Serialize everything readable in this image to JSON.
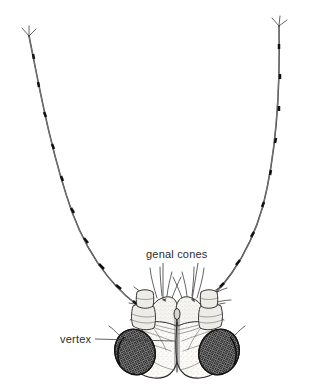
{
  "figure": {
    "background_color": "#ffffff",
    "ink_color": "#2a2a2a",
    "label_color": "#2b2b2b",
    "width": 322,
    "height": 391
  },
  "labels": [
    {
      "id": "genal-cones",
      "text": "genal cones",
      "x": 146,
      "y": 258,
      "leaders": 2
    },
    {
      "id": "vertex",
      "text": "vertex",
      "x": 60,
      "y": 343,
      "leaders": 1
    }
  ],
  "structures": {
    "antenna_left_label": "left antenna",
    "antenna_right_label": "right antenna",
    "eye_left_label": "left compound eye",
    "eye_right_label": "right compound eye",
    "genal_cone_left_label": "left genal cone",
    "genal_cone_right_label": "right genal cone",
    "vertex_label": "vertex plate",
    "suture_label": "median coronal suture",
    "scape_left_label": "left antennal scape",
    "scape_right_label": "right antennal scape"
  }
}
